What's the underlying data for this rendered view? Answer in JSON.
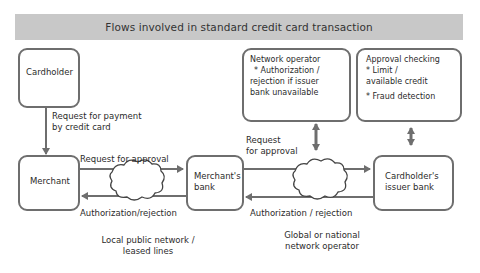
{
  "title": "Flows involved in standard credit card transaction",
  "nodes": {
    "cardholder": {
      "label": "Cardholder"
    },
    "merchant": {
      "label": "Merchant"
    },
    "merchants_bank": {
      "line1": "Merchant's",
      "line2": "bank"
    },
    "issuer_bank": {
      "line1": "Cardholder's",
      "line2": "issuer bank"
    },
    "network_operator": {
      "heading": "Network operator",
      "lines": [
        "* Authorization /",
        "rejection if issuer",
        "bank unavailable"
      ]
    },
    "approval_checking": {
      "heading": "Approval checking",
      "lines": [
        "* Limit /",
        "available credit",
        "* Fraud detection"
      ]
    }
  },
  "edges": {
    "cardholder_to_merchant": {
      "line1": "Request for payment",
      "line2": "by credit card"
    },
    "merchant_to_bank": "Request for approval",
    "bank_to_merchant": "Authorization/rejection",
    "bank_to_issuer": {
      "line1": "Request",
      "line2": "for approval"
    },
    "issuer_to_bank": "Authorization / rejection"
  },
  "networks": {
    "local": {
      "line1": "Local public network /",
      "line2": "leased lines"
    },
    "global": {
      "line1": "Global or national",
      "line2": "network operator"
    }
  },
  "colors": {
    "title_bg": "#c8c8c8",
    "stroke": "#6e6e6e",
    "text": "#2b2b2b"
  }
}
